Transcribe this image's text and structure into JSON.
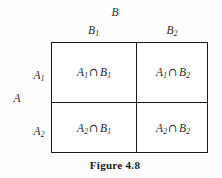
{
  "figure": {
    "caption": "Figure 4.8",
    "row_group_label": "A",
    "column_group_label": "B",
    "column_headers": [
      {
        "base": "B",
        "sub": "1"
      },
      {
        "base": "B",
        "sub": "2"
      }
    ],
    "row_headers": [
      {
        "base": "A",
        "sub": "1"
      },
      {
        "base": "A",
        "sub": "2"
      }
    ],
    "intersection_symbol": "∩",
    "cells": [
      [
        {
          "left_base": "A",
          "left_sub": "1",
          "right_base": "B",
          "right_sub": "1"
        },
        {
          "left_base": "A",
          "left_sub": "1",
          "right_base": "B",
          "right_sub": "2"
        }
      ],
      [
        {
          "left_base": "A",
          "left_sub": "2",
          "right_base": "B",
          "right_sub": "1"
        },
        {
          "left_base": "A",
          "left_sub": "2",
          "right_base": "B",
          "right_sub": "2"
        }
      ]
    ],
    "colors": {
      "background": "#fefefe",
      "line": "#1a1a1a",
      "text": "#2a2a2a",
      "caption_text": "#1a1a1a"
    }
  }
}
